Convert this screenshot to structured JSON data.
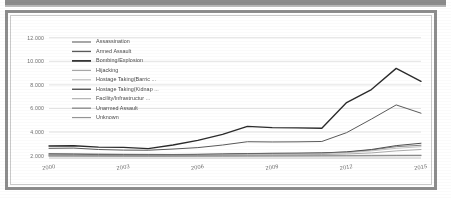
{
  "figure": {
    "frame_color": "#8d8d8d",
    "background": "#ffffff",
    "top_bar_color": "#8b8b8b"
  },
  "chart_data": {
    "type": "line",
    "title": "",
    "subtitle": "",
    "xlabel": "",
    "ylabel": "",
    "grid": true,
    "legend_position": "inside-upper-left",
    "x": [
      2000,
      2001,
      2002,
      2003,
      2004,
      2005,
      2006,
      2007,
      2008,
      2009,
      2010,
      2011,
      2012,
      2013,
      2014,
      2015
    ],
    "xtick_labels": [
      "2000",
      "2003",
      "2006",
      "2009",
      "2012",
      "2015"
    ],
    "xtick_values": [
      2000,
      2003,
      2006,
      2009,
      2012,
      2015
    ],
    "xlim": [
      2000,
      2015
    ],
    "ytick_labels": [
      "2.000",
      "4.000",
      "6.000",
      "8.000",
      "10.000",
      "12.000"
    ],
    "ytick_values": [
      2000,
      4000,
      6000,
      8000,
      10000,
      12000
    ],
    "ylim": [
      1800,
      12400
    ],
    "series": [
      {
        "name": "Assassination",
        "color": "#6e6e6e",
        "width": 0.85,
        "values": [
          2180,
          2160,
          2140,
          2120,
          2110,
          2100,
          2120,
          2150,
          2180,
          2200,
          2210,
          2230,
          2300,
          2480,
          2760,
          2880
        ]
      },
      {
        "name": "Armed Assault",
        "color": "#5a5a5a",
        "width": 1.0,
        "values": [
          2620,
          2640,
          2520,
          2470,
          2460,
          2560,
          2680,
          2900,
          3180,
          3160,
          3170,
          3200,
          3950,
          5100,
          6300,
          5600
        ]
      },
      {
        "name": "Bombing/Explosion",
        "color": "#2b2b2b",
        "width": 1.35,
        "values": [
          2820,
          2840,
          2720,
          2700,
          2600,
          2900,
          3300,
          3800,
          4480,
          4380,
          4350,
          4320,
          6500,
          7600,
          9400,
          8300
        ]
      },
      {
        "name": "Hijacking",
        "color": "#9a9a9a",
        "width": 0.7,
        "values": [
          1980,
          1975,
          1970,
          1965,
          1960,
          1960,
          1965,
          1970,
          1975,
          1980,
          1985,
          1990,
          1995,
          2000,
          2010,
          2015
        ]
      },
      {
        "name": "Hostage Taking(Barric ...",
        "color": "#b5b5b5",
        "width": 0.65,
        "values": [
          1990,
          1985,
          1980,
          1978,
          1975,
          1978,
          1982,
          1988,
          1995,
          2000,
          2005,
          2010,
          2020,
          2040,
          2060,
          2070
        ]
      },
      {
        "name": "Hostage Taking(Kidnap ...",
        "color": "#4f4f4f",
        "width": 1.0,
        "values": [
          2120,
          2110,
          2090,
          2080,
          2070,
          2075,
          2100,
          2130,
          2170,
          2190,
          2200,
          2230,
          2320,
          2520,
          2850,
          3050
        ]
      },
      {
        "name": "Facility/Infrastructur ...",
        "color": "#aaaaaa",
        "width": 0.7,
        "values": [
          2060,
          2055,
          2040,
          2030,
          2025,
          2035,
          2055,
          2085,
          2120,
          2140,
          2155,
          2180,
          2250,
          2400,
          2620,
          2760
        ]
      },
      {
        "name": "Unarmed Assault",
        "color": "#777777",
        "width": 0.75,
        "values": [
          1960,
          1958,
          1955,
          1952,
          1950,
          1952,
          1955,
          1958,
          1962,
          1965,
          1968,
          1972,
          1978,
          1985,
          1995,
          2000
        ]
      },
      {
        "name": "Unknown",
        "color": "#8f8f8f",
        "width": 0.75,
        "values": [
          2030,
          2025,
          2015,
          2008,
          2005,
          2010,
          2020,
          2035,
          2055,
          2070,
          2080,
          2095,
          2140,
          2230,
          2400,
          2520
        ]
      }
    ]
  }
}
